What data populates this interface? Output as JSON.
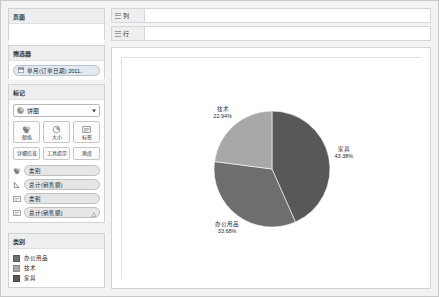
{
  "app": {
    "name": "Tableau Worksheet",
    "background": "#f3f3f3"
  },
  "sidebar": {
    "pages": {
      "title": "页面",
      "drop_hint": ""
    },
    "filters": {
      "title": "筛选器",
      "pills": [
        {
          "label": "单月(订单日期) 2011..",
          "icon": "calendar-icon"
        }
      ]
    },
    "marks": {
      "title": "标记",
      "selected_mark": "饼图",
      "mark_icon": "pie-icon",
      "buttons_primary": [
        {
          "label": "颜色",
          "icon": "color-icon"
        },
        {
          "label": "大小",
          "icon": "size-icon"
        },
        {
          "label": "标签",
          "icon": "label-icon"
        }
      ],
      "buttons_secondary": [
        {
          "label": "详细信息",
          "icon": "detail-icon"
        },
        {
          "label": "工具提示",
          "icon": "tooltip-icon"
        },
        {
          "label": "角度",
          "icon": "angle-icon"
        }
      ],
      "shelf_pills": [
        {
          "icon": "color-icon",
          "label": "类别",
          "warning": ""
        },
        {
          "icon": "angle-icon",
          "label": "总计(销售额)",
          "warning": ""
        },
        {
          "icon": "label-icon",
          "label": "类别",
          "warning": ""
        },
        {
          "icon": "label-icon",
          "label": "总计(销售额)",
          "warning": "△"
        }
      ]
    },
    "legend": {
      "title": "类别",
      "items": [
        {
          "label": "办公用品",
          "color": "#6e6e6e"
        },
        {
          "label": "技术",
          "color": "#a8a8a8"
        },
        {
          "label": "家具",
          "color": "#585858"
        }
      ]
    }
  },
  "shelves": [
    {
      "name": "columns",
      "label": "列",
      "icon": "grid-icon",
      "value": ""
    },
    {
      "name": "rows",
      "label": "行",
      "icon": "grid-icon",
      "value": ""
    }
  ],
  "chart_data": {
    "type": "pie",
    "title": "",
    "xlabel": "",
    "ylabel": "",
    "legend_position": "left-sidebar",
    "grid": false,
    "categories": [
      "家具",
      "办公用品",
      "技术"
    ],
    "values": [
      43.38,
      33.68,
      22.94
    ],
    "unit": "%",
    "colors": [
      "#585858",
      "#6e6e6e",
      "#a8a8a8"
    ],
    "labels": [
      {
        "name": "家具",
        "pct": "43.38%",
        "color": "#585858"
      },
      {
        "name": "办公用品",
        "pct": "33.68%",
        "color": "#6e6e6e"
      },
      {
        "name": "技术",
        "pct": "22.94%",
        "color": "#a8a8a8"
      }
    ]
  }
}
